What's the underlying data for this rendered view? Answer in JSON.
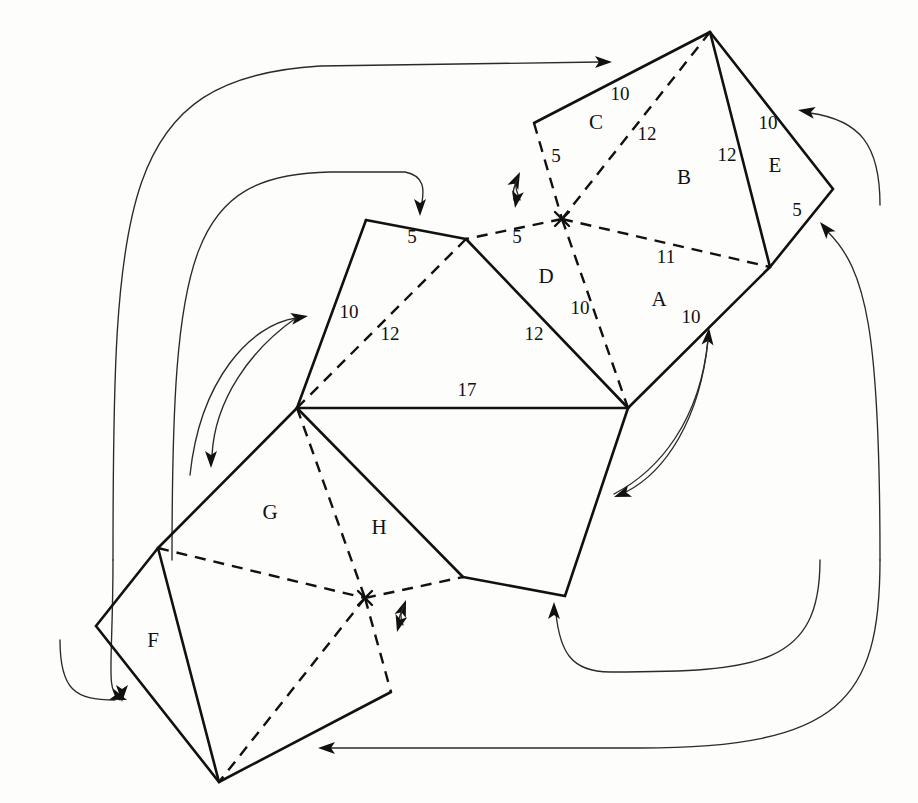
{
  "figure": {
    "background_color": "#fdfdfb",
    "ink_color": "#111111",
    "face_labels": [
      {
        "id": "A",
        "text": "A",
        "x": 659,
        "y": 306
      },
      {
        "id": "B",
        "text": "B",
        "x": 684,
        "y": 184
      },
      {
        "id": "C",
        "text": "C",
        "x": 596,
        "y": 129
      },
      {
        "id": "D",
        "text": "D",
        "x": 546,
        "y": 283
      },
      {
        "id": "E",
        "text": "E",
        "x": 775,
        "y": 172
      },
      {
        "id": "F",
        "text": "F",
        "x": 153,
        "y": 647
      },
      {
        "id": "G",
        "text": "G",
        "x": 270,
        "y": 519
      },
      {
        "id": "H",
        "text": "H",
        "x": 379,
        "y": 534
      }
    ],
    "edge_labels": [
      {
        "id": "c-top",
        "text": "10",
        "x": 620,
        "y": 100
      },
      {
        "id": "c-diag",
        "text": "12",
        "x": 647,
        "y": 140
      },
      {
        "id": "c-left",
        "text": "5",
        "x": 556,
        "y": 162
      },
      {
        "id": "b-right",
        "text": "12",
        "x": 727,
        "y": 161
      },
      {
        "id": "e-top",
        "text": "10",
        "x": 768,
        "y": 129
      },
      {
        "id": "e-bottom",
        "text": "5",
        "x": 797,
        "y": 216
      },
      {
        "id": "a-diag",
        "text": "11",
        "x": 666,
        "y": 263
      },
      {
        "id": "d-left",
        "text": "5",
        "x": 517,
        "y": 243
      },
      {
        "id": "d-right",
        "text": "10",
        "x": 580,
        "y": 314
      },
      {
        "id": "a-right",
        "text": "10",
        "x": 691,
        "y": 323
      },
      {
        "id": "g-top",
        "text": "5",
        "x": 412,
        "y": 243
      },
      {
        "id": "g-left",
        "text": "10",
        "x": 349,
        "y": 318
      },
      {
        "id": "g-diag",
        "text": "12",
        "x": 390,
        "y": 340
      },
      {
        "id": "d-bottom",
        "text": "12",
        "x": 534,
        "y": 340
      },
      {
        "id": "base",
        "text": "17",
        "x": 467,
        "y": 396
      }
    ],
    "polygons": {
      "solid_paths": [
        "M 710 32 L 534 123",
        "M 710 32 L 770 267",
        "M 710 32 L 833 189 L 770 267",
        "M 770 267 L 628 408",
        "M 366 220 L 466 239",
        "M 366 220 L 297 408",
        "M 466 239 L 628 408",
        "M 297 408 L 628 408",
        "M 297 408 L 158 548",
        "M 297 408 L 463 577",
        "M 628 408 L 565 596 L 463 577",
        "M 158 548 L 96 626 L 219 782 L 391 692",
        "M 158 548 L 219 782"
      ],
      "dashed_paths": [
        "M 534 123 L 562 219",
        "M 710 32 L 562 219",
        "M 562 219 L 466 239",
        "M 562 219 L 770 267",
        "M 562 219 L 628 408",
        "M 466 239 L 297 408",
        "M 297 408 L 365 598",
        "M 158 548 L 365 598",
        "M 365 598 L 463 577",
        "M 365 598 L 219 782",
        "M 365 598 L 391 692"
      ],
      "hub_points": [
        {
          "id": "upper-hub",
          "x": 562,
          "y": 219
        },
        {
          "id": "lower-hub",
          "x": 365,
          "y": 598
        }
      ]
    },
    "flow_arrows": [
      {
        "id": "outer-top-arrow",
        "path": "M 113 560 C 113 200 120 78 320 66 L 600 62",
        "head": {
          "x": 612,
          "y": 62,
          "angle": 0
        }
      },
      {
        "id": "inner-top-arrow",
        "path": "M 172 560 C 172 250 190 175 330 172 L 405 172 C 425 176 424 190 422 202",
        "head": {
          "x": 420,
          "y": 216,
          "angle": 90
        }
      },
      {
        "id": "left-down-arrow",
        "path": "M 113 560 C 113 665 105 690 120 700",
        "head": {
          "x": 122,
          "y": 702,
          "angle": 90
        }
      },
      {
        "id": "left-lower-arrow",
        "path": "M 60 640 C 60 690 75 700 115 700",
        "head": {
          "x": 127,
          "y": 700,
          "angle": 20
        }
      },
      {
        "id": "right-upper-arrow",
        "path": "M 880 205 C 880 145 860 120 810 113",
        "head": {
          "x": 798,
          "y": 110,
          "angle": 190
        }
      },
      {
        "id": "right-lower-arrow",
        "path": "M 880 560 C 880 330 866 270 828 232",
        "head": {
          "x": 820,
          "y": 222,
          "angle": 230
        }
      },
      {
        "id": "bottom-return-arrow",
        "path": "M 880 560 C 880 700 840 748 640 748 L 330 748",
        "head": {
          "x": 318,
          "y": 748,
          "angle": 180
        }
      },
      {
        "id": "inner-bottom-arrow",
        "path": "M 820 560 C 820 665 760 672 610 672 C 570 672 560 650 556 614",
        "head": {
          "x": 554,
          "y": 602,
          "angle": 270
        }
      },
      {
        "id": "mid-left-arrow",
        "path": "M 190 475 C 200 380 250 325 296 318",
        "head": {
          "x": 308,
          "y": 316,
          "angle": 350
        }
      },
      {
        "id": "mid-left-down-arrow",
        "path": "M 296 318 C 250 350 215 400 212 455",
        "head": {
          "x": 211,
          "y": 468,
          "angle": 90
        }
      },
      {
        "id": "mid-right-arrow",
        "path": "M 614 494 C 660 470 700 420 708 340",
        "head": {
          "x": 709,
          "y": 328,
          "angle": 275
        }
      },
      {
        "id": "mid-right-down-arrow",
        "path": "M 708 340 C 700 420 665 472 626 492",
        "head": {
          "x": 614,
          "y": 497,
          "angle": 160
        }
      },
      {
        "id": "hub-up-arrow-top",
        "path": "M 520 200 C 516 190 514 184 518 178",
        "head": {
          "x": 520,
          "y": 172,
          "angle": 295
        }
      },
      {
        "id": "hub-down-arrow-top",
        "path": "M 518 178 C 514 186 512 192 514 200",
        "head": {
          "x": 515,
          "y": 208,
          "angle": 100
        }
      },
      {
        "id": "hub-up-arrow-bottom",
        "path": "M 403 625 C 400 618 400 612 404 606",
        "head": {
          "x": 406,
          "y": 600,
          "angle": 290
        }
      },
      {
        "id": "hub-down-arrow-bottom",
        "path": "M 404 606 C 400 614 398 620 398 626",
        "head": {
          "x": 397,
          "y": 632,
          "angle": 105
        }
      }
    ]
  }
}
